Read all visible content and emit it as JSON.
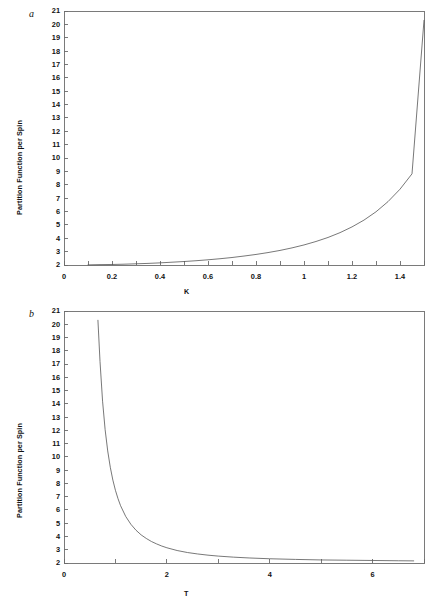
{
  "figure": {
    "background_color": "#ffffff",
    "line_color": "#555555",
    "axis_color": "#6b6b6b",
    "text_color": "#111111"
  },
  "panels": [
    {
      "letter": "a",
      "ylabel": "Partition Function per Spin",
      "xlabel": "K"
    },
    {
      "letter": "b",
      "ylabel": "Partition Function per Spin",
      "xlabel": "T"
    }
  ],
  "chart_data": [
    {
      "type": "line",
      "title": "",
      "panel": "a",
      "xlabel": "K",
      "ylabel": "Partition Function per Spin",
      "xlim": [
        0,
        1.5
      ],
      "ylim": [
        2,
        21
      ],
      "grid": false,
      "legend": "none",
      "xticks": [
        0,
        0.1,
        0.2,
        0.3,
        0.4,
        0.5,
        0.6,
        0.7,
        0.8,
        0.9,
        1,
        1.1,
        1.2,
        1.3,
        1.4,
        1.5
      ],
      "xtick_labels": [
        "0",
        "",
        "0.2",
        "",
        "0.4",
        "",
        "0.6",
        "",
        "0.8",
        "",
        "1",
        "",
        "1.2",
        "",
        "1.4",
        ""
      ],
      "yticks": [
        2,
        3,
        4,
        5,
        6,
        7,
        8,
        9,
        10,
        11,
        12,
        13,
        14,
        15,
        16,
        17,
        18,
        19,
        20,
        21
      ],
      "ytick_labels": [
        "2",
        "3",
        "4",
        "5",
        "6",
        "7",
        "8",
        "9",
        "10",
        "11",
        "12",
        "13",
        "14",
        "15",
        "16",
        "17",
        "18",
        "19",
        "20",
        "21"
      ],
      "series": [
        {
          "name": "Z per spin vs K",
          "x": [
            0.1,
            0.15,
            0.2,
            0.25,
            0.3,
            0.35,
            0.4,
            0.45,
            0.5,
            0.55,
            0.6,
            0.65,
            0.7,
            0.75,
            0.8,
            0.85,
            0.9,
            0.95,
            1.0,
            1.05,
            1.1,
            1.15,
            1.2,
            1.25,
            1.3,
            1.35,
            1.4,
            1.45,
            1.5
          ],
          "y": [
            2.01,
            2.03,
            2.04,
            2.06,
            2.09,
            2.12,
            2.16,
            2.21,
            2.26,
            2.32,
            2.39,
            2.47,
            2.56,
            2.67,
            2.79,
            2.93,
            3.09,
            3.28,
            3.5,
            3.76,
            4.06,
            4.42,
            4.85,
            5.36,
            5.98,
            6.74,
            7.67,
            8.82,
            20.3
          ]
        }
      ]
    },
    {
      "type": "line",
      "title": "",
      "panel": "b",
      "xlabel": "T",
      "ylabel": "Partition Function per Spin",
      "xlim": [
        0,
        7
      ],
      "ylim": [
        2,
        21
      ],
      "grid": false,
      "legend": "none",
      "xticks": [
        0,
        1,
        2,
        3,
        4,
        5,
        6,
        7
      ],
      "xtick_labels": [
        "0",
        "",
        "2",
        "",
        "4",
        "",
        "6",
        ""
      ],
      "yticks": [
        2,
        3,
        4,
        5,
        6,
        7,
        8,
        9,
        10,
        11,
        12,
        13,
        14,
        15,
        16,
        17,
        18,
        19,
        20,
        21
      ],
      "ytick_labels": [
        "2",
        "3",
        "4",
        "5",
        "6",
        "7",
        "8",
        "9",
        "10",
        "11",
        "12",
        "13",
        "14",
        "15",
        "16",
        "17",
        "18",
        "19",
        "20",
        "21"
      ],
      "series": [
        {
          "name": "Z per spin vs T",
          "x": [
            0.66,
            0.7,
            0.75,
            0.8,
            0.85,
            0.9,
            0.95,
            1.0,
            1.05,
            1.1,
            1.2,
            1.3,
            1.4,
            1.5,
            1.6,
            1.7,
            1.8,
            1.9,
            2.0,
            2.2,
            2.4,
            2.6,
            2.8,
            3.0,
            3.3,
            3.6,
            4.0,
            4.5,
            5.0,
            5.5,
            6.0,
            6.5,
            6.8
          ],
          "y": [
            20.3,
            17.2,
            14.2,
            12.05,
            10.45,
            9.22,
            8.25,
            7.48,
            6.85,
            6.32,
            5.51,
            4.92,
            4.47,
            4.12,
            3.85,
            3.62,
            3.44,
            3.28,
            3.15,
            2.94,
            2.79,
            2.68,
            2.59,
            2.52,
            2.44,
            2.38,
            2.32,
            2.27,
            2.23,
            2.21,
            2.19,
            2.17,
            2.16
          ]
        }
      ]
    }
  ]
}
